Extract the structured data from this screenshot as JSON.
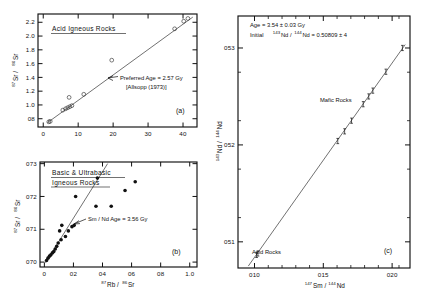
{
  "figure": {
    "panels": [
      {
        "id": "(a)",
        "title": "Acid Igneous Rocks",
        "annotation_line1": "Preferred  Age = 2.57 Gy",
        "annotation_line2": "[Allsopp (1973)]",
        "xaxis": {
          "label_pre": "87",
          "label_mid": "Rb /",
          "label_sup2": "86",
          "label_end": "Sr",
          "ticks": [
            "0",
            "10",
            "20",
            "30",
            "40"
          ],
          "range": [
            -1.5,
            44
          ]
        },
        "yaxis": {
          "label_pre": "87",
          "label_mid": "Sr /",
          "label_sup2": "86",
          "label_end": "Sr",
          "ticks": [
            "0.8",
            "1.0",
            "1.2",
            "1.4",
            "1.6",
            "1.8",
            "2.0",
            "2.2"
          ],
          "range": [
            0.68,
            2.32
          ]
        },
        "marker_style": "open-circle"
      },
      {
        "id": "(b)",
        "title_line1": "Basic & Ultrabasic",
        "title_line2": "Igneous Rocks",
        "annotation_line1": "Sm / Nd    Age = 3.56 Gy",
        "xaxis": {
          "label_pre": "87",
          "label_mid": "Rb /",
          "label_sup2": "86",
          "label_end": "Sr",
          "ticks": [
            "0",
            "0.2",
            "0.4",
            "0.6",
            "0.8",
            "1.0"
          ],
          "range": [
            -0.03,
            1.05
          ]
        },
        "yaxis": {
          "label_pre": "87",
          "label_mid": "Sr /",
          "label_sup2": "86",
          "label_end": "Sr",
          "ticks": [
            "0.70",
            "0.71",
            "0.72",
            "0.73"
          ],
          "range": [
            0.6985,
            0.7305
          ]
        },
        "marker_style": "filled-circle"
      },
      {
        "id": "(c)",
        "annotation_line1": "Age  =   3.54 ± 0.03  Gy",
        "annotation_line2_pre": "Initial",
        "annotation_line2_sup1": "143",
        "annotation_line2_mid": "Nd /",
        "annotation_line2_sup2": "144",
        "annotation_line2_end": "Nd = 0.50809 ± 4",
        "label_mafic": "Mafic Rocks",
        "label_acid": "Acid Rocks",
        "xaxis": {
          "label_pre": "147",
          "label_mid": "Sm /",
          "label_sup2": "144",
          "label_end": "Nd",
          "ticks": [
            "0.10",
            "0.15",
            "0.20"
          ],
          "range": [
            0.088,
            0.213
          ]
        },
        "yaxis": {
          "label_pre": "143",
          "label_mid": "Nd /",
          "label_sup2": "144",
          "label_end": "Nd",
          "ticks": [
            "0.51",
            "0.52",
            "0.53"
          ],
          "range": [
            0.5073,
            0.5333
          ]
        },
        "marker_style": "error-bar-point"
      }
    ]
  },
  "chart_data": [
    {
      "type": "scatter",
      "panel": "(a)",
      "title": "Acid Igneous Rocks",
      "xlabel": "87Rb / 86Sr",
      "ylabel": "87Sr / 86Sr",
      "xlim": [
        -1.5,
        44
      ],
      "ylim": [
        0.68,
        2.32
      ],
      "xticks": [
        0,
        10,
        20,
        30,
        40
      ],
      "yticks": [
        0.8,
        1.0,
        1.2,
        1.4,
        1.6,
        1.8,
        2.0,
        2.2
      ],
      "grid": false,
      "marker": "open-circle",
      "x": [
        1.6,
        2.0,
        5.6,
        6.4,
        7.0,
        7.6,
        8.2,
        7.4,
        11.6,
        19.6,
        37.6,
        40.2,
        41.4
      ],
      "y": [
        0.755,
        0.762,
        0.925,
        0.945,
        0.96,
        0.975,
        0.99,
        1.11,
        1.155,
        1.65,
        2.105,
        2.215,
        2.255
      ],
      "fit_line": {
        "x": [
          1.2,
          42.8
        ],
        "y": [
          0.742,
          2.275
        ],
        "label": "Preferred Age = 2.57 Gy"
      },
      "annotations": [
        "Preferred  Age = 2.57 Gy",
        "[Allsopp (1973)]"
      ]
    },
    {
      "type": "scatter",
      "panel": "(b)",
      "title": "Basic & Ultrabasic Igneous Rocks",
      "xlabel": "87Rb / 86Sr",
      "ylabel": "87Sr / 86Sr",
      "xlim": [
        -0.03,
        1.05
      ],
      "ylim": [
        0.6985,
        0.7305
      ],
      "xticks": [
        0,
        0.2,
        0.4,
        0.6,
        0.8,
        1.0
      ],
      "yticks": [
        0.7,
        0.71,
        0.72,
        0.73
      ],
      "grid": false,
      "marker": "filled-circle",
      "x": [
        0.015,
        0.025,
        0.035,
        0.045,
        0.055,
        0.065,
        0.075,
        0.085,
        0.095,
        0.105,
        0.115,
        0.12,
        0.145,
        0.165,
        0.19,
        0.205,
        0.215,
        0.355,
        0.365,
        0.46,
        0.555,
        0.625
      ],
      "y": [
        0.7005,
        0.7012,
        0.7018,
        0.7022,
        0.7028,
        0.7032,
        0.704,
        0.7048,
        0.7058,
        0.7095,
        0.7068,
        0.7112,
        0.7078,
        0.7095,
        0.7108,
        0.7112,
        0.72,
        0.717,
        0.7256,
        0.717,
        0.7218,
        0.7245
      ],
      "fit_line": {
        "x": [
          0.008,
          0.435
        ],
        "y": [
          0.6998,
          0.73
        ],
        "label": "Sm / Nd Age = 3.56 Gy"
      },
      "annotations": [
        "Sm / Nd    Age = 3.56 Gy"
      ]
    },
    {
      "type": "scatter",
      "panel": "(c)",
      "title": "",
      "xlabel": "147Sm / 144Nd",
      "ylabel": "143Nd / 144Nd",
      "xlim": [
        0.088,
        0.213
      ],
      "ylim": [
        0.5073,
        0.5333
      ],
      "xticks": [
        0.1,
        0.15,
        0.2
      ],
      "yticks": [
        0.51,
        0.52,
        0.53
      ],
      "grid": false,
      "marker": "error-bar-point",
      "x": [
        0.1015,
        0.1025,
        0.1605,
        0.1655,
        0.1705,
        0.179,
        0.183,
        0.186,
        0.1955,
        0.2075
      ],
      "y": [
        0.50865,
        0.5088,
        0.5204,
        0.5214,
        0.5225,
        0.5242,
        0.525,
        0.5256,
        0.52755,
        0.53
      ],
      "fit_line": {
        "x": [
          0.0955,
          0.2095
        ],
        "y": [
          0.5075,
          0.53035
        ],
        "label": "Age = 3.54 ± 0.03 Gy"
      },
      "annotations": [
        "Age  =   3.54 ± 0.03  Gy",
        "Initial 143Nd / 144Nd = 0.50809 ± 4",
        "Mafic Rocks",
        "Acid Rocks"
      ]
    }
  ]
}
